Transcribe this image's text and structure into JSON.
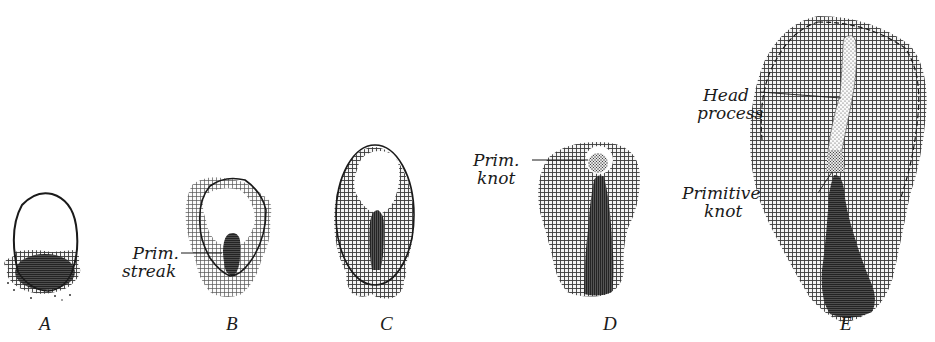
{
  "figure": {
    "stages": [
      {
        "id": "A",
        "label": "A"
      },
      {
        "id": "B",
        "label": "B",
        "annotation": {
          "line1": "Prim.",
          "line2": "streak"
        }
      },
      {
        "id": "C",
        "label": "C"
      },
      {
        "id": "D",
        "label": "D",
        "annotation": {
          "line1": "Prim.",
          "line2": "knot"
        }
      },
      {
        "id": "E",
        "label": "E",
        "annotations": [
          {
            "line1": "Head",
            "line2": "process"
          },
          {
            "line1": "Primitive",
            "line2": "knot"
          }
        ]
      }
    ]
  },
  "colors": {
    "background": "#ffffff",
    "ink": "#1a1a1a",
    "hatch": "#3a3a3a",
    "streak": "#2b2b2b"
  }
}
